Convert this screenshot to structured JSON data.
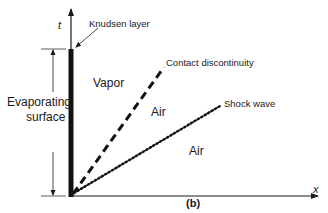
{
  "figure": {
    "caption": "(b)",
    "axes": {
      "x_label": "x",
      "y_label": "t"
    },
    "annotations": {
      "knudsen_layer": "Knudsen layer",
      "contact_discontinuity": "Contact discontinuity",
      "shock_wave": "Shock wave",
      "evaporating_surface_line1": "Evaporating",
      "evaporating_surface_line2": "surface"
    },
    "regions": {
      "vapor": "Vapor",
      "air_middle": "Air",
      "air_lower": "Air"
    },
    "colors": {
      "ink": "#1a1a1a",
      "background": "#ffffff"
    }
  }
}
